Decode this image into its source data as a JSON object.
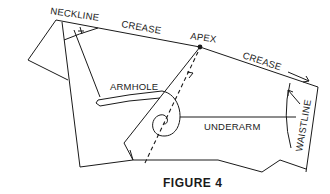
{
  "diagram": {
    "labels": {
      "neckline": "NECKLINE",
      "crease_left": "CREASE",
      "apex": "APEX",
      "crease_right": "CREASE",
      "armhole": "ARMHOLE",
      "underarm": "UNDERARM",
      "waistline": "WAISTLINE"
    },
    "caption": "FIGURE 4",
    "colors": {
      "line": "#1a1a1a",
      "background": "#ffffff"
    }
  }
}
